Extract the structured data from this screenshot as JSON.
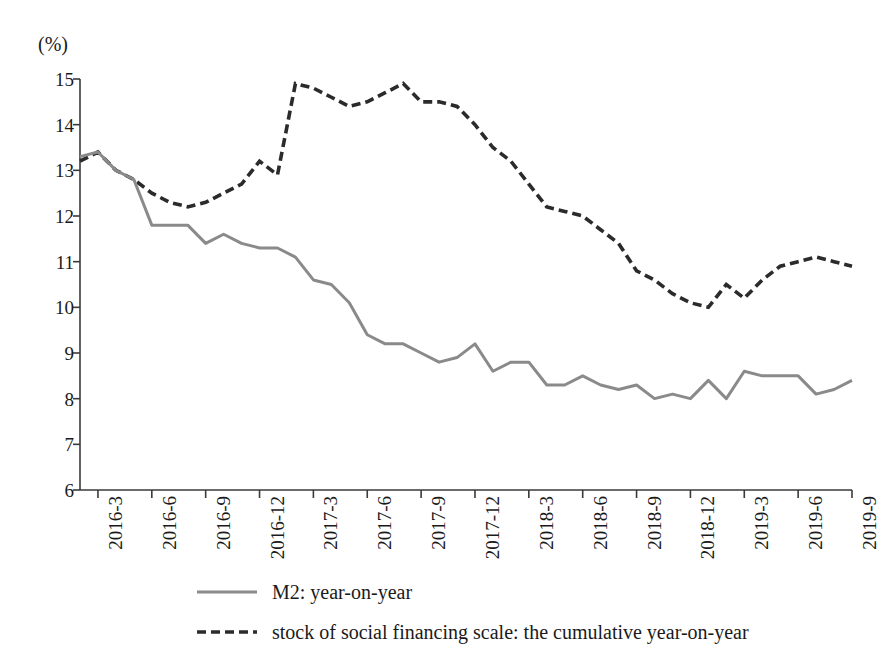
{
  "unit_label": "(%)",
  "colors": {
    "m2_line": "#8a8a8a",
    "social_financing_line": "#2b2b2b",
    "axis": "#3a3a3a",
    "background": "#ffffff"
  },
  "legend": {
    "items": [
      {
        "label": "M2: year-on-year",
        "style": "solid",
        "color": "#8a8a8a",
        "icon": "solid-line-swatch"
      },
      {
        "label": "stock of social financing scale: the cumulative year-on-year",
        "style": "dashed",
        "color": "#2b2b2b",
        "icon": "dashed-line-swatch"
      }
    ]
  },
  "chart_data": {
    "type": "line",
    "title": "",
    "xlabel": "",
    "ylabel": "(%)",
    "ylim": [
      6,
      15
    ],
    "yticks": [
      15,
      14,
      13,
      12,
      11,
      10,
      9,
      8,
      7,
      6
    ],
    "grid": false,
    "legend_position": "bottom",
    "xtick_labels": [
      "2016-3",
      "2016-6",
      "2016-9",
      "2016-12",
      "2017-3",
      "2017-6",
      "2017-9",
      "2017-12",
      "2018-3",
      "2018-6",
      "2018-9",
      "2018-12",
      "2019-3",
      "2019-6",
      "2019-9"
    ],
    "xtick_indices": [
      1,
      4,
      7,
      10,
      13,
      16,
      19,
      22,
      25,
      28,
      31,
      34,
      37,
      40,
      43
    ],
    "x": [
      "2016-2",
      "2016-3",
      "2016-4",
      "2016-5",
      "2016-6",
      "2016-7",
      "2016-8",
      "2016-9",
      "2016-10",
      "2016-11",
      "2016-12",
      "2017-1",
      "2017-2",
      "2017-3",
      "2017-4",
      "2017-5",
      "2017-6",
      "2017-7",
      "2017-8",
      "2017-9",
      "2017-10",
      "2017-11",
      "2017-12",
      "2018-1",
      "2018-2",
      "2018-3",
      "2018-4",
      "2018-5",
      "2018-6",
      "2018-7",
      "2018-8",
      "2018-9",
      "2018-10",
      "2018-11",
      "2018-12",
      "2019-1",
      "2019-2",
      "2019-3",
      "2019-4",
      "2019-5",
      "2019-6",
      "2019-7",
      "2019-8",
      "2019-9"
    ],
    "series": [
      {
        "name": "M2: year-on-year",
        "style": "solid",
        "color": "#8a8a8a",
        "values": [
          13.3,
          13.4,
          13.0,
          12.8,
          11.8,
          11.8,
          11.8,
          11.4,
          11.6,
          11.4,
          11.3,
          11.3,
          11.1,
          10.6,
          10.5,
          10.1,
          9.4,
          9.2,
          9.2,
          9.0,
          8.8,
          8.9,
          9.2,
          8.6,
          8.8,
          8.8,
          8.3,
          8.3,
          8.5,
          8.3,
          8.2,
          8.3,
          8.0,
          8.1,
          8.0,
          8.4,
          8.0,
          8.6,
          8.5,
          8.5,
          8.5,
          8.1,
          8.2,
          8.4
        ],
        "annotated_points": {
          "start": 13.3,
          "local_max_2016_3": 13.4,
          "plateau_2016_5_to_7": 11.8,
          "sharp_dip_2016_8": 10.2,
          "recovery_peak_2016_9": 11.6,
          "trough_2018_12": 8.0,
          "end_2019_9": 8.5
        }
      },
      {
        "name": "stock of social financing scale: the cumulative year-on-year",
        "style": "dashed",
        "color": "#2b2b2b",
        "values": [
          13.2,
          13.4,
          13.0,
          12.8,
          12.5,
          12.3,
          12.2,
          12.3,
          12.5,
          12.7,
          13.2,
          12.9,
          14.9,
          14.8,
          14.6,
          14.4,
          14.5,
          14.7,
          14.9,
          14.5,
          14.5,
          14.4,
          14.0,
          13.5,
          13.2,
          12.7,
          12.2,
          12.1,
          12.0,
          11.7,
          11.4,
          10.8,
          10.6,
          10.3,
          10.1,
          10.0,
          10.5,
          10.2,
          10.6,
          10.9,
          11.0,
          11.1,
          11.0,
          10.9
        ],
        "annotated_points": {
          "start": 13.2,
          "local_min_2016_8": 12.2,
          "jump_to_peak_2017_2": 14.9,
          "second_peak_2017_8": 14.9,
          "trough_2019_1": 9.9,
          "end_2019_9": 10.9
        }
      }
    ]
  }
}
